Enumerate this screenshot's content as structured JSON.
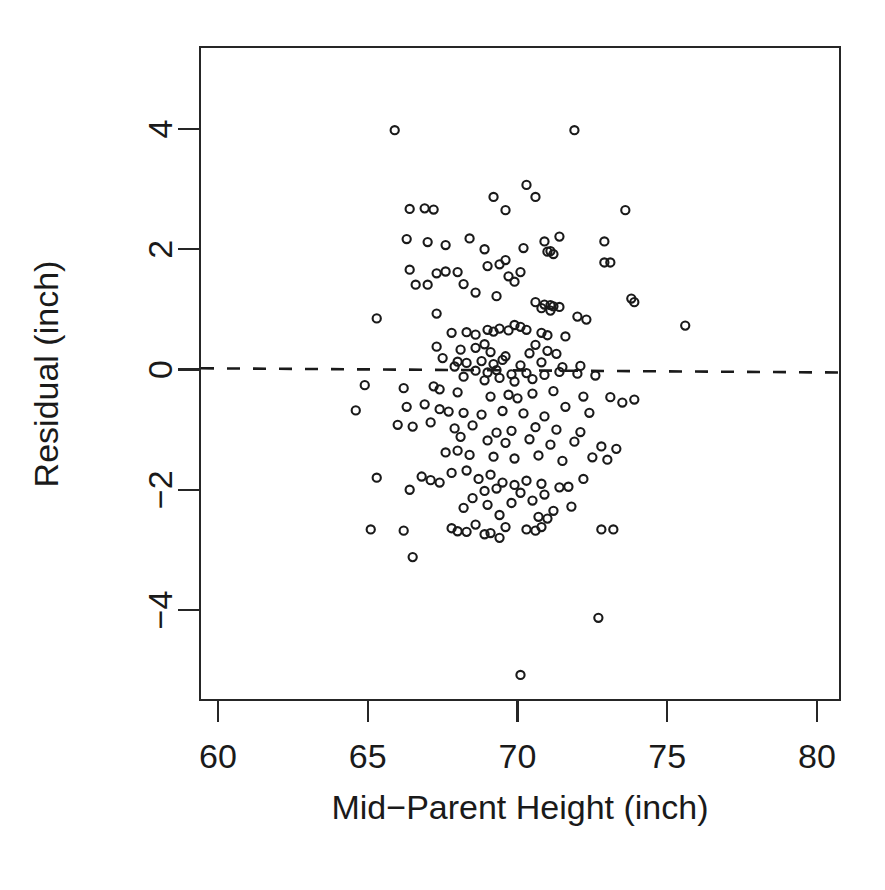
{
  "chart_data": {
    "type": "scatter",
    "title": "",
    "subtitle": "",
    "xlabel": "Mid−Parent Height (inch)",
    "ylabel": "Residual (inch)",
    "xlim": [
      59.4,
      80.7
    ],
    "ylim": [
      -5.6,
      4.75
    ],
    "xticks": [
      60,
      65,
      70,
      75,
      80
    ],
    "xtick_labels": [
      "60",
      "65",
      "70",
      "75",
      "80"
    ],
    "yticks": [
      -4,
      -2,
      0,
      2,
      4
    ],
    "ytick_labels": [
      "−4",
      "−2",
      "0",
      "2",
      "4"
    ],
    "grid": false,
    "legend": "none",
    "marker": "open-circle",
    "marker_color": "#1a1a1a",
    "n_points": 205,
    "annotations": [
      {
        "type": "reference-line",
        "orientation": "horizontal-dashed",
        "label": "zero-residual-line",
        "y_left": 0.02,
        "y_right": -0.05,
        "style": "dashed",
        "color": "#1a1a1a"
      }
    ],
    "series": [
      {
        "name": "residuals",
        "points": [
          [
            65.9,
            3.98
          ],
          [
            71.9,
            3.98
          ],
          [
            70.3,
            3.07
          ],
          [
            69.2,
            2.87
          ],
          [
            70.6,
            2.87
          ],
          [
            66.4,
            2.67
          ],
          [
            67.2,
            2.66
          ],
          [
            69.6,
            2.65
          ],
          [
            73.6,
            2.65
          ],
          [
            66.9,
            2.68
          ],
          [
            66.3,
            2.17
          ],
          [
            67.0,
            2.12
          ],
          [
            67.6,
            2.07
          ],
          [
            68.4,
            2.18
          ],
          [
            70.9,
            2.13
          ],
          [
            71.4,
            2.21
          ],
          [
            72.9,
            2.13
          ],
          [
            70.2,
            2.02
          ],
          [
            71.0,
            1.96
          ],
          [
            68.9,
            2.0
          ],
          [
            66.4,
            1.66
          ],
          [
            67.3,
            1.6
          ],
          [
            67.6,
            1.63
          ],
          [
            69.0,
            1.72
          ],
          [
            69.4,
            1.75
          ],
          [
            69.6,
            1.82
          ],
          [
            70.1,
            1.62
          ],
          [
            72.9,
            1.78
          ],
          [
            73.1,
            1.78
          ],
          [
            68.0,
            1.62
          ],
          [
            66.6,
            1.41
          ],
          [
            67.0,
            1.41
          ],
          [
            68.2,
            1.42
          ],
          [
            69.7,
            1.55
          ],
          [
            69.9,
            1.46
          ],
          [
            68.6,
            1.28
          ],
          [
            69.3,
            1.22
          ],
          [
            71.1,
            1.97
          ],
          [
            71.2,
            1.92
          ],
          [
            70.6,
            1.12
          ],
          [
            70.9,
            1.08
          ],
          [
            71.1,
            1.07
          ],
          [
            71.2,
            1.05
          ],
          [
            73.8,
            1.18
          ],
          [
            73.9,
            1.12
          ],
          [
            71.4,
            1.04
          ],
          [
            70.8,
            1.02
          ],
          [
            71.1,
            0.98
          ],
          [
            65.3,
            0.85
          ],
          [
            67.3,
            0.93
          ],
          [
            72.0,
            0.88
          ],
          [
            72.3,
            0.83
          ],
          [
            75.6,
            0.73
          ],
          [
            69.0,
            0.66
          ],
          [
            69.2,
            0.63
          ],
          [
            69.4,
            0.68
          ],
          [
            69.7,
            0.65
          ],
          [
            70.3,
            0.66
          ],
          [
            70.8,
            0.61
          ],
          [
            71.0,
            0.57
          ],
          [
            68.3,
            0.62
          ],
          [
            68.6,
            0.58
          ],
          [
            67.8,
            0.61
          ],
          [
            71.6,
            0.55
          ],
          [
            70.1,
            0.71
          ],
          [
            69.9,
            0.74
          ],
          [
            67.3,
            0.38
          ],
          [
            68.1,
            0.33
          ],
          [
            68.6,
            0.36
          ],
          [
            69.1,
            0.29
          ],
          [
            70.4,
            0.27
          ],
          [
            71.0,
            0.31
          ],
          [
            71.3,
            0.26
          ],
          [
            68.9,
            0.42
          ],
          [
            69.6,
            0.22
          ],
          [
            70.6,
            0.41
          ],
          [
            67.5,
            0.19
          ],
          [
            68.0,
            0.13
          ],
          [
            68.3,
            0.11
          ],
          [
            68.8,
            0.14
          ],
          [
            69.2,
            0.09
          ],
          [
            69.5,
            0.16
          ],
          [
            70.1,
            0.07
          ],
          [
            70.8,
            0.12
          ],
          [
            71.5,
            0.04
          ],
          [
            72.1,
            0.06
          ],
          [
            67.9,
            0.05
          ],
          [
            68.6,
            -0.02
          ],
          [
            69.0,
            -0.05
          ],
          [
            69.3,
            -0.01
          ],
          [
            69.8,
            -0.08
          ],
          [
            70.3,
            -0.06
          ],
          [
            70.9,
            -0.09
          ],
          [
            71.4,
            -0.04
          ],
          [
            72.0,
            -0.07
          ],
          [
            72.6,
            -0.1
          ],
          [
            68.2,
            -0.12
          ],
          [
            68.9,
            -0.18
          ],
          [
            69.4,
            -0.14
          ],
          [
            69.9,
            -0.2
          ],
          [
            70.5,
            -0.16
          ],
          [
            64.9,
            -0.26
          ],
          [
            66.2,
            -0.31
          ],
          [
            67.2,
            -0.28
          ],
          [
            67.4,
            -0.33
          ],
          [
            68.0,
            -0.38
          ],
          [
            69.7,
            -0.42
          ],
          [
            70.5,
            -0.4
          ],
          [
            71.2,
            -0.36
          ],
          [
            72.2,
            -0.45
          ],
          [
            73.1,
            -0.46
          ],
          [
            73.9,
            -0.5
          ],
          [
            70.0,
            -0.48
          ],
          [
            69.1,
            -0.45
          ],
          [
            64.6,
            -0.68
          ],
          [
            66.3,
            -0.62
          ],
          [
            66.9,
            -0.58
          ],
          [
            67.4,
            -0.66
          ],
          [
            68.2,
            -0.72
          ],
          [
            68.8,
            -0.75
          ],
          [
            69.5,
            -0.69
          ],
          [
            70.2,
            -0.73
          ],
          [
            70.9,
            -0.78
          ],
          [
            71.6,
            -0.62
          ],
          [
            72.4,
            -0.72
          ],
          [
            73.5,
            -0.55
          ],
          [
            67.7,
            -0.7
          ],
          [
            66.0,
            -0.92
          ],
          [
            66.5,
            -0.95
          ],
          [
            67.1,
            -0.88
          ],
          [
            67.9,
            -0.98
          ],
          [
            68.5,
            -0.93
          ],
          [
            69.3,
            -1.05
          ],
          [
            69.8,
            -1.02
          ],
          [
            70.6,
            -0.96
          ],
          [
            71.3,
            -1.0
          ],
          [
            72.1,
            -1.04
          ],
          [
            68.1,
            -1.12
          ],
          [
            69.0,
            -1.18
          ],
          [
            69.6,
            -1.22
          ],
          [
            70.4,
            -1.16
          ],
          [
            71.1,
            -1.25
          ],
          [
            71.9,
            -1.2
          ],
          [
            72.8,
            -1.28
          ],
          [
            73.3,
            -1.32
          ],
          [
            67.6,
            -1.38
          ],
          [
            68.4,
            -1.42
          ],
          [
            69.2,
            -1.45
          ],
          [
            69.9,
            -1.48
          ],
          [
            70.7,
            -1.43
          ],
          [
            71.5,
            -1.52
          ],
          [
            72.5,
            -1.46
          ],
          [
            73.0,
            -1.5
          ],
          [
            68.0,
            -1.35
          ],
          [
            66.8,
            -1.78
          ],
          [
            67.8,
            -1.72
          ],
          [
            68.3,
            -1.68
          ],
          [
            68.7,
            -1.82
          ],
          [
            69.1,
            -1.75
          ],
          [
            69.5,
            -1.88
          ],
          [
            69.9,
            -1.92
          ],
          [
            70.3,
            -1.85
          ],
          [
            70.8,
            -1.9
          ],
          [
            71.4,
            -1.96
          ],
          [
            72.2,
            -1.82
          ],
          [
            65.3,
            -1.8
          ],
          [
            67.1,
            -1.84
          ],
          [
            67.4,
            -1.88
          ],
          [
            66.4,
            -2.0
          ],
          [
            68.9,
            -2.02
          ],
          [
            69.3,
            -1.98
          ],
          [
            70.1,
            -2.05
          ],
          [
            70.9,
            -2.08
          ],
          [
            71.7,
            -1.95
          ],
          [
            68.5,
            -2.14
          ],
          [
            69.0,
            -2.25
          ],
          [
            69.8,
            -2.22
          ],
          [
            70.5,
            -2.18
          ],
          [
            71.2,
            -2.35
          ],
          [
            71.8,
            -2.28
          ],
          [
            68.2,
            -2.3
          ],
          [
            69.4,
            -2.42
          ],
          [
            70.7,
            -2.45
          ],
          [
            71.0,
            -2.48
          ],
          [
            65.1,
            -2.66
          ],
          [
            66.2,
            -2.68
          ],
          [
            67.8,
            -2.64
          ],
          [
            68.0,
            -2.69
          ],
          [
            68.3,
            -2.7
          ],
          [
            68.6,
            -2.58
          ],
          [
            69.1,
            -2.72
          ],
          [
            69.6,
            -2.62
          ],
          [
            70.3,
            -2.66
          ],
          [
            70.6,
            -2.68
          ],
          [
            70.8,
            -2.62
          ],
          [
            72.8,
            -2.66
          ],
          [
            73.2,
            -2.66
          ],
          [
            69.4,
            -2.8
          ],
          [
            68.9,
            -2.74
          ],
          [
            66.5,
            -3.12
          ],
          [
            72.7,
            -4.13
          ],
          [
            70.1,
            -5.08
          ]
        ]
      }
    ]
  },
  "figure": {
    "plot_area": {
      "left": 200,
      "top": 47,
      "right": 840,
      "bottom": 700
    },
    "background_color": "#ffffff",
    "axis_color": "#262626"
  }
}
